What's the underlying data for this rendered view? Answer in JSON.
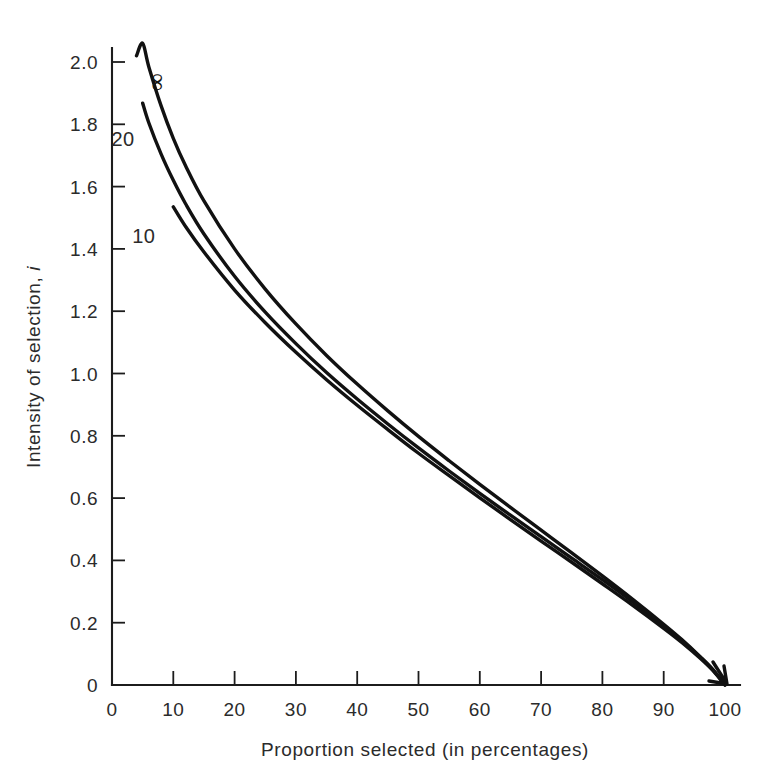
{
  "chart_data": {
    "type": "line",
    "title": "",
    "xlabel": "Proportion selected (in percentages)",
    "ylabel": "Intensity of selection, i",
    "ylabel_text": "Intensity of selection, ",
    "ylabel_italic": "i",
    "xlim": [
      0,
      100
    ],
    "ylim": [
      0,
      2.0
    ],
    "grid": false,
    "legend_position": "inline-curve-labels",
    "xticks": [
      0,
      10,
      20,
      30,
      40,
      50,
      60,
      70,
      80,
      90,
      100
    ],
    "xtick_labels": [
      "0",
      "10",
      "20",
      "30",
      "40",
      "50",
      "60",
      "70",
      "80",
      "90",
      "100"
    ],
    "yticks": [
      0,
      0.2,
      0.4,
      0.6,
      0.8,
      1.0,
      1.2,
      1.4,
      1.6,
      1.8,
      2.0
    ],
    "ytick_labels": [
      "0",
      "0.2",
      "0.4",
      "0.6",
      "0.8",
      "1.0",
      "1.2",
      "1.4",
      "1.6",
      "1.8",
      "2.0"
    ],
    "series": [
      {
        "name": "infinity",
        "label": "∞",
        "color": "#111111",
        "x": [
          4,
          5,
          6,
          8,
          10,
          12,
          15,
          20,
          25,
          30,
          35,
          40,
          45,
          50,
          55,
          60,
          65,
          70,
          75,
          80,
          85,
          90,
          93,
          96,
          98,
          100
        ],
        "y": [
          2.02,
          2.06,
          1.985,
          1.86,
          1.755,
          1.667,
          1.554,
          1.4,
          1.271,
          1.159,
          1.058,
          0.966,
          0.88,
          0.798,
          0.72,
          0.644,
          0.57,
          0.497,
          0.424,
          0.35,
          0.274,
          0.195,
          0.145,
          0.09,
          0.05,
          0.0
        ]
      },
      {
        "name": "n20",
        "label": "20",
        "color": "#111111",
        "x": [
          5,
          6,
          8,
          10,
          12,
          15,
          20,
          25,
          30,
          35,
          40,
          45,
          50,
          55,
          60,
          65,
          70,
          75,
          80,
          85,
          90,
          93,
          96,
          98,
          100
        ],
        "y": [
          1.868,
          1.805,
          1.705,
          1.62,
          1.545,
          1.448,
          1.312,
          1.197,
          1.096,
          1.003,
          0.918,
          0.838,
          0.761,
          0.687,
          0.615,
          0.545,
          0.476,
          0.407,
          0.338,
          0.266,
          0.19,
          0.142,
          0.088,
          0.049,
          0.0
        ]
      },
      {
        "name": "n10",
        "label": "10",
        "color": "#111111",
        "x": [
          10,
          12,
          15,
          20,
          25,
          30,
          35,
          40,
          45,
          50,
          55,
          60,
          65,
          70,
          75,
          80,
          85,
          90,
          93,
          96,
          98,
          100
        ],
        "y": [
          1.535,
          1.472,
          1.39,
          1.268,
          1.163,
          1.068,
          0.98,
          0.898,
          0.82,
          0.744,
          0.672,
          0.601,
          0.531,
          0.462,
          0.394,
          0.325,
          0.255,
          0.182,
          0.136,
          0.085,
          0.047,
          0.0
        ]
      }
    ],
    "curve_labels": [
      {
        "text": "∞",
        "x_data": 6.2,
        "y_data": 1.935,
        "rotated": true
      },
      {
        "text": "20",
        "x_data": 1.8,
        "y_data": 1.73,
        "rotated": false
      },
      {
        "text": "10",
        "x_data": 5.2,
        "y_data": 1.42,
        "rotated": false
      }
    ]
  }
}
